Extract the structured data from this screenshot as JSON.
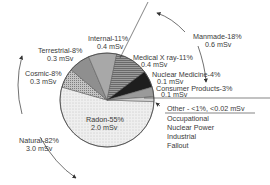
{
  "chart_data": {
    "type": "pie",
    "title": "",
    "unit": "mSv",
    "slices": [
      {
        "name": "Radon",
        "percent": 55,
        "dose": 2.0,
        "label": "Radon-55%",
        "sub": "2.0 mSv",
        "fill": "#ececec",
        "pattern": "dots"
      },
      {
        "name": "Cosmic",
        "percent": 8,
        "dose": 0.3,
        "label": "Cosmic-8%",
        "sub": "0.3 mSv",
        "fill": "#b4b4b4",
        "pattern": "fine-dots"
      },
      {
        "name": "Terrestrial",
        "percent": 8,
        "dose": 0.3,
        "label": "Terrestrial-8%",
        "sub": "0.3 mSv",
        "fill": "#8f8f8f",
        "pattern": "solid"
      },
      {
        "name": "Internal",
        "percent": 11,
        "dose": 0.4,
        "label": "Internal-11%",
        "sub": "0.4 mSv",
        "fill": "#a8a8a8",
        "pattern": "solid"
      },
      {
        "name": "Medical X ray",
        "percent": 11,
        "dose": 0.4,
        "label": "Medical X ray-11%",
        "sub": "0.4 mSv",
        "fill": "#7a7a7a",
        "pattern": "hlines"
      },
      {
        "name": "Nuclear Medicine",
        "percent": 4,
        "dose": 0.1,
        "label": "Nuclear Medicine-4%",
        "sub": "0.1 mSv",
        "fill": "#1e1e1e",
        "pattern": "solid"
      },
      {
        "name": "Consumer Products",
        "percent": 3,
        "dose": 0.1,
        "label": "Consumer Products-3%",
        "sub": "0.1 mSv",
        "fill": "#9a9a9a",
        "pattern": "solid"
      },
      {
        "name": "Other",
        "percent": 1,
        "dose": 0.02,
        "label": "Other - <1%, <0.02 mSv",
        "sub": "",
        "fill": "#cfcfcf",
        "pattern": "solid"
      }
    ],
    "groups": [
      {
        "name": "Natural",
        "label": "Natural-82%",
        "sub": "3.0 mSv",
        "percent": 82,
        "dose": 3.0
      },
      {
        "name": "Manmade",
        "label": "Manmade-18%",
        "sub": "0.6 mSv",
        "percent": 18,
        "dose": 0.6
      }
    ],
    "other_items": [
      "Occupational",
      "Nuclear Power",
      "Industrial",
      "Fallout"
    ],
    "legend_position": "none (direct labels)"
  }
}
